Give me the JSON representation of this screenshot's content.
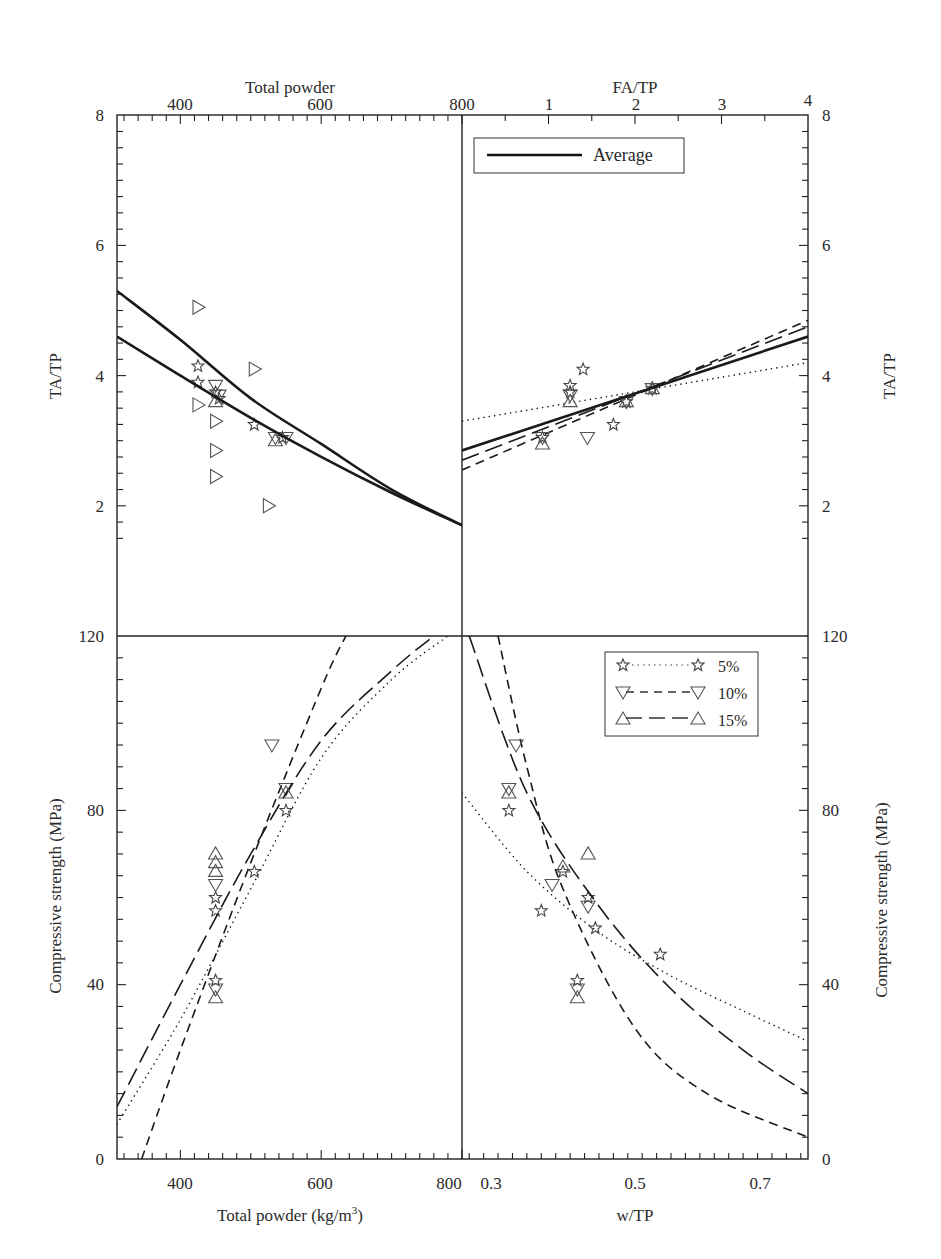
{
  "figure": {
    "top_left": {
      "x_axis_title": "Total powder",
      "x_ticks": [
        "400",
        "600",
        "800"
      ],
      "y_axis_title": "TA/TP",
      "y_ticks": [
        "2",
        "4",
        "6",
        "8"
      ]
    },
    "top_right": {
      "x_axis_title": "FA/TP",
      "x_ticks": [
        "1",
        "2",
        "3",
        "4"
      ],
      "y_axis_title": "TA/TP",
      "y_ticks": [
        "2",
        "4",
        "6",
        "8"
      ],
      "legend": {
        "average_label": "Average"
      }
    },
    "bottom_left": {
      "x_axis_title": "Total powder (kg/m",
      "x_axis_title_sup": "3",
      "x_axis_title_end": ")",
      "x_ticks": [
        "400",
        "600",
        "800"
      ],
      "y_axis_title": "Compressive strength (MPa)",
      "y_ticks": [
        "0",
        "40",
        "80",
        "120"
      ]
    },
    "bottom_right": {
      "x_axis_title": "w/TP",
      "x_ticks": [
        "0.3",
        "0.5",
        "0.7"
      ],
      "y_axis_title": "Compressive strength (MPa)",
      "y_ticks": [
        "0",
        "40",
        "80",
        "120"
      ],
      "legend": {
        "s5": "5%",
        "s10": "10%",
        "s15": "15%"
      }
    }
  },
  "chart_data": [
    {
      "type": "scatter",
      "title": "",
      "xlabel": "Total powder",
      "ylabel": "TA/TP",
      "xlim": [
        310,
        800
      ],
      "ylim": [
        0,
        8
      ],
      "series": [
        {
          "name": "5%",
          "marker": "star",
          "points": [
            [
              425,
              4.15
            ],
            [
              425,
              3.9
            ],
            [
              450,
              3.75
            ],
            [
              455,
              3.65
            ],
            [
              505,
              3.25
            ],
            [
              545,
              3.05
            ]
          ]
        },
        {
          "name": "10%",
          "marker": "triangle-down",
          "points": [
            [
              450,
              3.85
            ],
            [
              455,
              3.7
            ],
            [
              535,
              3.05
            ],
            [
              550,
              3.05
            ]
          ]
        },
        {
          "name": "15%",
          "marker": "triangle-up",
          "points": [
            [
              450,
              3.6
            ],
            [
              535,
              3.0
            ]
          ]
        },
        {
          "name": "other",
          "marker": "triangle-right",
          "points": [
            [
              425,
              5.05
            ],
            [
              425,
              3.55
            ],
            [
              450,
              3.3
            ],
            [
              450,
              2.85
            ],
            [
              450,
              2.45
            ],
            [
              505,
              4.1
            ],
            [
              525,
              2.0
            ]
          ]
        },
        {
          "name": "Average (upper fit)",
          "style": "solid",
          "points": [
            [
              310,
              5.3
            ],
            [
              400,
              4.55
            ],
            [
              500,
              3.65
            ],
            [
              600,
              2.95
            ],
            [
              700,
              2.25
            ],
            [
              800,
              1.7
            ]
          ]
        },
        {
          "name": "Average (lower fit)",
          "style": "solid",
          "points": [
            [
              310,
              4.6
            ],
            [
              400,
              4.0
            ],
            [
              500,
              3.35
            ],
            [
              600,
              2.75
            ],
            [
              700,
              2.2
            ],
            [
              800,
              1.7
            ]
          ]
        }
      ]
    },
    {
      "type": "scatter",
      "xlabel": "FA/TP",
      "ylabel": "TA/TP",
      "xlim": [
        0,
        4
      ],
      "ylim": [
        0,
        8
      ],
      "series": [
        {
          "name": "5%",
          "style": "dotted",
          "marker": "star",
          "points": [
            [
              0.93,
              3.05
            ],
            [
              1.25,
              3.75
            ],
            [
              1.25,
              3.85
            ],
            [
              1.4,
              4.1
            ],
            [
              1.75,
              3.25
            ],
            [
              1.9,
              3.6
            ],
            [
              2.2,
              3.8
            ]
          ],
          "fit": [
            [
              0,
              3.3
            ],
            [
              4,
              4.2
            ]
          ]
        },
        {
          "name": "10%",
          "style": "dashed",
          "marker": "triangle-down",
          "points": [
            [
              0.93,
              3.05
            ],
            [
              1.25,
              3.7
            ],
            [
              1.45,
              3.05
            ],
            [
              1.9,
              3.6
            ],
            [
              2.2,
              3.8
            ]
          ],
          "fit": [
            [
              0,
              2.55
            ],
            [
              4,
              4.85
            ]
          ]
        },
        {
          "name": "15%",
          "style": "long-dashed",
          "marker": "triangle-up",
          "points": [
            [
              0.93,
              2.95
            ],
            [
              1.25,
              3.6
            ],
            [
              1.9,
              3.6
            ],
            [
              2.2,
              3.8
            ]
          ],
          "fit": [
            [
              0,
              2.7
            ],
            [
              4,
              4.75
            ]
          ]
        },
        {
          "name": "Average",
          "style": "solid",
          "fit": [
            [
              0,
              2.85
            ],
            [
              4,
              4.6
            ]
          ]
        }
      ]
    },
    {
      "type": "scatter",
      "xlabel": "Total powder (kg/m3)",
      "ylabel": "Compressive strength (MPa)",
      "xlim": [
        310,
        800
      ],
      "ylim": [
        0,
        120
      ],
      "series": [
        {
          "name": "5%",
          "style": "dotted",
          "marker": "star",
          "points": [
            [
              450,
              41
            ],
            [
              450,
              57
            ],
            [
              450,
              60
            ],
            [
              505,
              66
            ],
            [
              550,
              80
            ]
          ],
          "fit": [
            [
              310,
              8
            ],
            [
              400,
              32
            ],
            [
              500,
              62
            ],
            [
              600,
              92
            ],
            [
              700,
              110
            ],
            [
              780,
              120
            ]
          ]
        },
        {
          "name": "10%",
          "style": "dashed",
          "marker": "triangle-down",
          "points": [
            [
              450,
              39
            ],
            [
              450,
              63
            ],
            [
              530,
              95
            ],
            [
              550,
              85
            ]
          ],
          "fit": [
            [
              345,
              0
            ],
            [
              400,
              25
            ],
            [
              500,
              68
            ],
            [
              600,
              108
            ],
            [
              635,
              120
            ]
          ]
        },
        {
          "name": "15%",
          "style": "long-dashed",
          "marker": "triangle-up",
          "points": [
            [
              450,
              37
            ],
            [
              450,
              66
            ],
            [
              450,
              68
            ],
            [
              450,
              70
            ],
            [
              550,
              84
            ]
          ],
          "fit": [
            [
              310,
              12
            ],
            [
              400,
              40
            ],
            [
              500,
              70
            ],
            [
              600,
              96
            ],
            [
              700,
              112
            ],
            [
              760,
              120
            ]
          ]
        }
      ]
    },
    {
      "type": "scatter",
      "xlabel": "w/TP",
      "ylabel": "Compressive strength (MPa)",
      "xlim": [
        0.26,
        0.74
      ],
      "ylim": [
        0,
        120
      ],
      "series": [
        {
          "name": "5%",
          "style": "dotted",
          "marker": "star",
          "points": [
            [
              0.325,
              80
            ],
            [
              0.37,
              57
            ],
            [
              0.4,
              66
            ],
            [
              0.42,
              41
            ],
            [
              0.435,
              60
            ],
            [
              0.445,
              53
            ],
            [
              0.535,
              47
            ]
          ],
          "fit": [
            [
              0.26,
              84
            ],
            [
              0.35,
              66
            ],
            [
              0.45,
              52
            ],
            [
              0.55,
              42
            ],
            [
              0.65,
              34
            ],
            [
              0.74,
              27
            ]
          ]
        },
        {
          "name": "10%",
          "style": "dashed",
          "marker": "triangle-down",
          "points": [
            [
              0.335,
              95
            ],
            [
              0.325,
              85
            ],
            [
              0.385,
              63
            ],
            [
              0.42,
              39
            ],
            [
              0.435,
              58
            ]
          ],
          "fit": [
            [
              0.31,
              120
            ],
            [
              0.35,
              90
            ],
            [
              0.4,
              62
            ],
            [
              0.5,
              30
            ],
            [
              0.6,
              15
            ],
            [
              0.74,
              5
            ]
          ]
        },
        {
          "name": "15%",
          "style": "long-dashed",
          "marker": "triangle-up",
          "points": [
            [
              0.325,
              84
            ],
            [
              0.4,
              67
            ],
            [
              0.42,
              37
            ],
            [
              0.435,
              70
            ]
          ],
          "fit": [
            [
              0.27,
              120
            ],
            [
              0.35,
              84
            ],
            [
              0.45,
              58
            ],
            [
              0.55,
              39
            ],
            [
              0.65,
              25
            ],
            [
              0.74,
              15
            ]
          ]
        }
      ]
    }
  ]
}
